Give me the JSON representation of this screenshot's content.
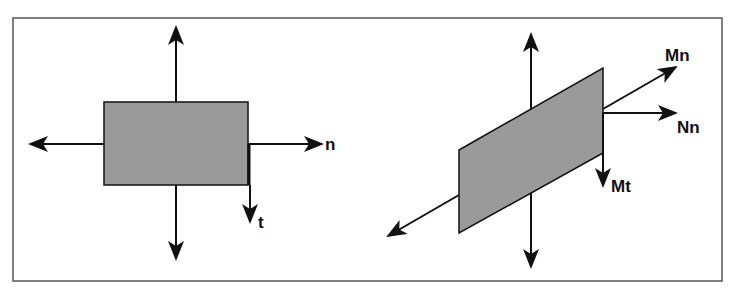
{
  "colors": {
    "frame": "#555555",
    "shape_fill": "#9a9a9a",
    "stroke": "#111111",
    "background": "#ffffff"
  },
  "left_panel": {
    "description": "Rectangular element with normal (n) and tangential (t) directions",
    "labels": {
      "n": "n",
      "t": "t"
    }
  },
  "right_panel": {
    "description": "Skewed (parallelogram) element with in-plane force and moment directions",
    "labels": {
      "Mn": "Mn",
      "Nn": "Nn",
      "Mt": "Mt"
    }
  }
}
